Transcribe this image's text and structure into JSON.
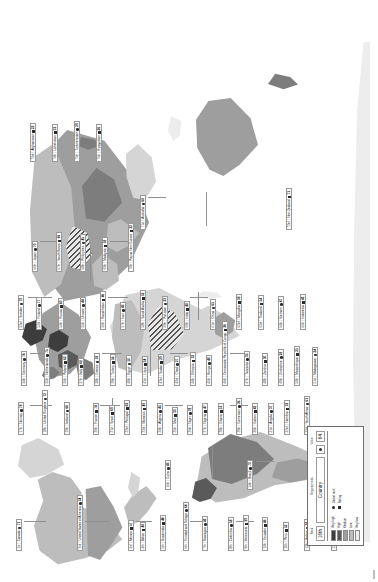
{
  "figure": {
    "orientation": "rotated-90-ccw",
    "type": "world-choropleth-map-with-country-callouts"
  },
  "legend": {
    "header": {
      "rank_cell": "16th",
      "country_cell": "Country",
      "measure_cell": "64",
      "icon_cell": "icon"
    },
    "captions": {
      "rank": "Rank",
      "regional_rank": "Regional rank",
      "value": "Value"
    },
    "scale_title": "Level",
    "scale": [
      {
        "label": "Very high",
        "color": "#3d3d3d"
      },
      {
        "label": "High",
        "color": "#5a5a5a"
      },
      {
        "label": "Medium",
        "color": "#9e9e9e"
      },
      {
        "label": "Low",
        "color": "#bdbdbd"
      },
      {
        "label": "Very low",
        "color": "#ededed"
      }
    ],
    "keys": [
      {
        "symbol": "circle",
        "label": "Global rank"
      },
      {
        "symbol": "square",
        "label": "Rating"
      }
    ]
  },
  "labels": [
    {
      "rank": "1st",
      "name": "Canada",
      "icon": "circle",
      "value": "71",
      "x": 31,
      "y": 16,
      "level": 2
    },
    {
      "rank": "2nd",
      "name": "United States of America",
      "icon": "circle",
      "value": "54",
      "x": 31,
      "y": 77,
      "level": 3
    },
    {
      "rank": "3rd",
      "name": "Mexico",
      "icon": "square",
      "value": "57",
      "x": 31,
      "y": 128,
      "level": 2
    },
    {
      "rank": "4th",
      "name": "Belize",
      "icon": "square",
      "value": "48",
      "x": 31,
      "y": 140,
      "level": 1
    },
    {
      "rank": "5th",
      "name": "Guatemala",
      "icon": "square",
      "value": "44",
      "x": 31,
      "y": 160,
      "level": 1
    },
    {
      "rank": "6th",
      "name": "Trinidad and Tobago",
      "icon": "circle",
      "value": "64",
      "x": 31,
      "y": 183,
      "level": 2
    },
    {
      "rank": "7th",
      "name": "Nicaragua",
      "icon": "circle",
      "value": "41",
      "x": 31,
      "y": 202,
      "level": 1
    },
    {
      "rank": "8th",
      "name": "Colombia",
      "icon": "circle",
      "value": "58",
      "x": 31,
      "y": 228,
      "level": 3
    },
    {
      "rank": "9th",
      "name": "Venezuela",
      "icon": "square",
      "value": "39",
      "x": 31,
      "y": 243,
      "level": 1
    },
    {
      "rank": "10th",
      "name": "Ecuador",
      "icon": "square",
      "value": "46",
      "x": 31,
      "y": 262,
      "level": 2
    },
    {
      "rank": "11th",
      "name": "Peru",
      "icon": "square",
      "value": "52",
      "x": 31,
      "y": 283,
      "level": 2
    },
    {
      "rank": "12th",
      "name": "Bolivia",
      "icon": "circle",
      "value": "38",
      "x": 31,
      "y": 304,
      "level": 1
    },
    {
      "rank": "13th",
      "name": "Chile",
      "icon": "square",
      "value": "67",
      "x": 31,
      "y": 331,
      "level": 3
    },
    {
      "rank": "14th",
      "name": "Brazil",
      "icon": "circle",
      "value": "73",
      "x": 92,
      "y": 247,
      "level": 4
    },
    {
      "rank": "15th",
      "name": "Argentina",
      "icon": "circle",
      "value": "55",
      "x": 92,
      "y": 331,
      "level": 3
    },
    {
      "rank": "16th",
      "name": "Cuba",
      "icon": "circle",
      "value": "43",
      "x": 92,
      "y": 165,
      "level": 1
    },
    {
      "rank": "17th",
      "name": "Norway",
      "icon": "circle",
      "value": "78",
      "x": 147,
      "y": 18,
      "level": 5
    },
    {
      "rank": "18th",
      "name": "United Kingdom",
      "icon": "circle",
      "value": "72",
      "x": 147,
      "y": 42,
      "level": 4
    },
    {
      "rank": "19th",
      "name": "Iceland",
      "icon": "circle",
      "value": "66",
      "x": 147,
      "y": 64,
      "level": 3
    },
    {
      "rank": "20th",
      "name": "France",
      "icon": "square",
      "value": "74",
      "x": 147,
      "y": 93,
      "level": 4
    },
    {
      "rank": "21st",
      "name": "Spain",
      "icon": "square",
      "value": "69",
      "x": 147,
      "y": 109,
      "level": 4
    },
    {
      "rank": "22nd",
      "name": "Portugal",
      "icon": "square",
      "value": "63",
      "x": 147,
      "y": 124,
      "level": 3
    },
    {
      "rank": "23rd",
      "name": "Morocco",
      "icon": "square",
      "value": "49",
      "x": 147,
      "y": 141,
      "level": 2
    },
    {
      "rank": "24th",
      "name": "Algeria",
      "icon": "circle",
      "value": "45",
      "x": 147,
      "y": 157,
      "level": 2
    },
    {
      "rank": "25th",
      "name": "Mali",
      "icon": "square",
      "value": "33",
      "x": 147,
      "y": 172,
      "level": 0
    },
    {
      "rank": "26th",
      "name": "Niger",
      "icon": "circle",
      "value": "31",
      "x": 147,
      "y": 187,
      "level": 0
    },
    {
      "rank": "27th",
      "name": "Nigeria",
      "icon": "square",
      "value": "47",
      "x": 147,
      "y": 202,
      "level": 2
    },
    {
      "rank": "28th",
      "name": "Ghana",
      "icon": "square",
      "value": "51",
      "x": 147,
      "y": 218,
      "level": 2
    },
    {
      "rank": "29th",
      "name": "Cameroon",
      "icon": "circle",
      "value": "36",
      "x": 147,
      "y": 236,
      "level": 1
    },
    {
      "rank": "30th",
      "name": "Gabon",
      "icon": "square",
      "value": "42",
      "x": 147,
      "y": 252,
      "level": 1
    },
    {
      "rank": "31st",
      "name": "Angola",
      "icon": "circle",
      "value": "37",
      "x": 147,
      "y": 268,
      "level": 1
    },
    {
      "rank": "32nd",
      "name": "Namibia",
      "icon": "square",
      "value": "53",
      "x": 147,
      "y": 284,
      "level": 2
    },
    {
      "rank": "33rd",
      "name": "South Africa",
      "icon": "circle",
      "value": "61",
      "x": 147,
      "y": 304,
      "level": 3
    },
    {
      "rank": "34th",
      "name": "Germany",
      "icon": "circle",
      "value": "76",
      "x": 196,
      "y": 21,
      "level": 6
    },
    {
      "rank": "35th",
      "name": "Netherlands",
      "icon": "circle",
      "value": "75",
      "x": 196,
      "y": 44,
      "level": 6
    },
    {
      "rank": "36th",
      "name": "Poland",
      "icon": "square",
      "value": "62",
      "x": 196,
      "y": 62,
      "level": 3
    },
    {
      "rank": "37th",
      "name": "Italy",
      "icon": "square",
      "value": "68",
      "x": 196,
      "y": 78,
      "level": 4
    },
    {
      "rank": "38th",
      "name": "Greece",
      "icon": "circle",
      "value": "59",
      "x": 196,
      "y": 94,
      "level": 3
    },
    {
      "rank": "39th",
      "name": "Turkey",
      "icon": "square",
      "value": "56",
      "x": 196,
      "y": 110,
      "level": 3
    },
    {
      "rank": "40th",
      "name": "Egypt",
      "icon": "circle",
      "value": "50",
      "x": 196,
      "y": 126,
      "level": 2
    },
    {
      "rank": "41st",
      "name": "Libya",
      "icon": "square",
      "value": "34",
      "x": 196,
      "y": 142,
      "level": 1
    },
    {
      "rank": "42nd",
      "name": "Sudan",
      "icon": "square",
      "value": "29",
      "x": 196,
      "y": 158,
      "level": 0
    },
    {
      "rank": "43rd",
      "name": "Chad",
      "icon": "circle",
      "value": "27",
      "x": 196,
      "y": 174,
      "level": 0
    },
    {
      "rank": "44th",
      "name": "Ethiopia",
      "icon": "square",
      "value": "32",
      "x": 196,
      "y": 190,
      "level": 0
    },
    {
      "rank": "45th",
      "name": "Kenya",
      "icon": "circle",
      "value": "40",
      "x": 196,
      "y": 206,
      "level": 1
    },
    {
      "rank": "46th",
      "name": "Democratic Republic of Congo",
      "icon": "square",
      "value": "26",
      "x": 196,
      "y": 222,
      "level": 0
    },
    {
      "rank": "47th",
      "name": "Tanzania",
      "icon": "circle",
      "value": "35",
      "x": 196,
      "y": 244,
      "level": 1
    },
    {
      "rank": "48th",
      "name": "Zambia",
      "icon": "square",
      "value": "30",
      "x": 196,
      "y": 262,
      "level": 0
    },
    {
      "rank": "49th",
      "name": "Zimbabwe",
      "icon": "circle",
      "value": "28",
      "x": 196,
      "y": 278,
      "level": 0
    },
    {
      "rank": "50th",
      "name": "Mozambique",
      "icon": "square",
      "value": "25",
      "x": 196,
      "y": 294,
      "level": 0
    },
    {
      "rank": "51st",
      "name": "Madagascar",
      "icon": "circle",
      "value": "24",
      "x": 196,
      "y": 312,
      "level": 0
    },
    {
      "rank": "52nd",
      "name": "Sweden",
      "icon": "circle",
      "value": "79",
      "x": 252,
      "y": 18,
      "level": 6
    },
    {
      "rank": "53rd",
      "name": "Finland",
      "icon": "circle",
      "value": "77",
      "x": 252,
      "y": 36,
      "level": 6
    },
    {
      "rank": "54th",
      "name": "Russia",
      "icon": "square",
      "value": "60",
      "x": 252,
      "y": 58,
      "level": 3
    },
    {
      "rank": "55th",
      "name": "Ukraine",
      "icon": "circle",
      "value": "44",
      "x": 252,
      "y": 80,
      "level": 2
    },
    {
      "rank": "56th",
      "name": "Kazakhstan",
      "icon": "square",
      "value": "46",
      "x": 252,
      "y": 100,
      "level": 2
    },
    {
      "rank": "57th",
      "name": "Iran",
      "icon": "circle",
      "value": "43",
      "x": 252,
      "y": 120,
      "level": 1
    },
    {
      "rank": "58th",
      "name": "Saudi Arabia",
      "icon": "square",
      "value": "52",
      "x": 252,
      "y": 140,
      "level": 2
    },
    {
      "rank": "59th",
      "name": "Pakistan",
      "icon": "circle",
      "value": "33",
      "x": 252,
      "y": 162,
      "level": 1
    },
    {
      "rank": "60th",
      "name": "India",
      "icon": "square",
      "value": "48",
      "x": 252,
      "y": 184,
      "level": 2
    },
    {
      "rank": "61st",
      "name": "China",
      "icon": "circle",
      "value": "65",
      "x": 252,
      "y": 210,
      "level": 4
    },
    {
      "rank": "62nd",
      "name": "Mongolia",
      "icon": "square",
      "value": "38",
      "x": 252,
      "y": 236,
      "level": 1
    },
    {
      "rank": "63rd",
      "name": "Thailand",
      "icon": "square",
      "value": "54",
      "x": 252,
      "y": 258,
      "level": 2
    },
    {
      "rank": "64th",
      "name": "Vietnam",
      "icon": "circle",
      "value": "47",
      "x": 252,
      "y": 278,
      "level": 2
    },
    {
      "rank": "65th",
      "name": "Indonesia",
      "icon": "square",
      "value": "41",
      "x": 252,
      "y": 300,
      "level": 1
    },
    {
      "rank": "66th",
      "name": "Japan",
      "icon": "circle",
      "value": "70",
      "x": 310,
      "y": 32,
      "level": 4
    },
    {
      "rank": "67th",
      "name": "South Korea",
      "icon": "square",
      "value": "66",
      "x": 310,
      "y": 56,
      "level": 4
    },
    {
      "rank": "68th",
      "name": "Philippines",
      "icon": "circle",
      "value": "45",
      "x": 310,
      "y": 80,
      "level": 2
    },
    {
      "rank": "69th",
      "name": "Malaysia",
      "icon": "square",
      "value": "58",
      "x": 310,
      "y": 102,
      "level": 3
    },
    {
      "rank": "70th",
      "name": "Papua New Guinea",
      "icon": "square",
      "value": "32",
      "x": 310,
      "y": 128,
      "level": 0
    },
    {
      "rank": "71st",
      "name": "Australia",
      "icon": "circle",
      "value": "68",
      "x": 352,
      "y": 140,
      "level": 3
    },
    {
      "rank": "72nd",
      "name": "New Zealand",
      "icon": "square",
      "value": "71",
      "x": 352,
      "y": 286,
      "level": 4
    },
    {
      "rank": "73rd",
      "name": "Afghanistan",
      "icon": "square",
      "value": "22",
      "x": 420,
      "y": 30,
      "level": 0
    },
    {
      "rank": "74th",
      "name": "Uzbekistan",
      "icon": "square",
      "value": "31",
      "x": 420,
      "y": 52,
      "level": 0
    },
    {
      "rank": "75th",
      "name": "Turkmenistan",
      "icon": "circle",
      "value": "29",
      "x": 420,
      "y": 74,
      "level": 0
    },
    {
      "rank": "76th",
      "name": "Kyrgyzstan",
      "icon": "square",
      "value": "26",
      "x": 420,
      "y": 96,
      "level": 0
    }
  ]
}
